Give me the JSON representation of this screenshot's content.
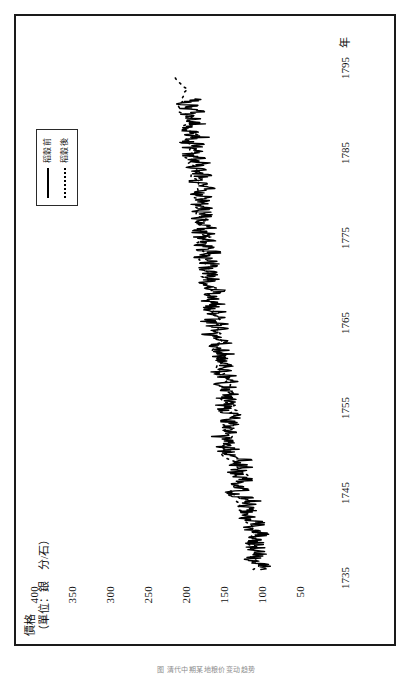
{
  "figure": {
    "caption": "图 清代中期某地粮价变动趋势"
  },
  "legend": {
    "position": "top-left",
    "items": [
      {
        "label": "稻穀前",
        "style": "solid"
      },
      {
        "label": "稻穀後",
        "style": "dashed"
      }
    ]
  },
  "colors": {
    "line": "#000000",
    "frame": "#1a1a1a",
    "background": "#ffffff"
  },
  "chart_data": {
    "type": "line",
    "title": "",
    "subtitle": "",
    "xlabel": "年",
    "ylabel": "價格",
    "ylabel_units": "（單位：銀　分/石）",
    "xlim": [
      1735,
      1796
    ],
    "ylim": [
      25,
      420
    ],
    "xticks": [
      1735,
      1745,
      1755,
      1765,
      1775,
      1785,
      1795
    ],
    "xticklabels": [
      "1735",
      "1745",
      "1755",
      "1765",
      "1775",
      "1785",
      "1795"
    ],
    "yticks": [
      50,
      100,
      150,
      200,
      250,
      300,
      350,
      400
    ],
    "yticklabels": [
      "50",
      "100",
      "150",
      "200",
      "250",
      "300",
      "350",
      "400"
    ],
    "grid": false,
    "rotated_90_ccw": true,
    "series": [
      {
        "name": "稻穀前",
        "style": "solid",
        "x": [
          1736.0,
          1736.3,
          1736.6,
          1736.9,
          1737.2,
          1737.5,
          1737.8,
          1738.1,
          1738.4,
          1738.7,
          1739.0,
          1739.3,
          1739.6,
          1739.9,
          1740.2,
          1740.5,
          1740.8,
          1741.1,
          1741.4,
          1741.7,
          1742.0,
          1742.3,
          1742.6,
          1742.9,
          1743.2,
          1743.5,
          1743.8,
          1744.1,
          1744.4,
          1744.7,
          1745.0,
          1745.3,
          1745.6,
          1745.9,
          1746.2,
          1746.5,
          1746.8,
          1747.1,
          1747.4,
          1747.7,
          1748.0,
          1748.3,
          1748.6,
          1748.9,
          1749.2,
          1749.5,
          1749.8,
          1750.1,
          1750.4,
          1750.7,
          1751.0,
          1751.3,
          1751.6,
          1751.9,
          1752.2,
          1752.5,
          1752.8,
          1753.1,
          1753.4,
          1753.7,
          1754.0,
          1754.3,
          1754.6,
          1754.9,
          1755.2,
          1755.5,
          1755.8,
          1756.1,
          1756.4,
          1756.7,
          1757.0,
          1757.3,
          1757.6,
          1757.9,
          1758.2,
          1758.5,
          1758.8,
          1759.1,
          1759.4,
          1759.7,
          1760.0,
          1760.3,
          1760.6,
          1760.9,
          1761.2,
          1761.5,
          1761.8,
          1762.1,
          1762.4,
          1762.7,
          1763.0,
          1763.3,
          1763.6,
          1763.9,
          1764.2,
          1764.5,
          1764.8,
          1765.1,
          1765.4,
          1765.7,
          1766.0,
          1766.3,
          1766.6,
          1766.9,
          1767.2,
          1767.5,
          1767.8,
          1768.1,
          1768.4,
          1768.7,
          1769.0,
          1769.3,
          1769.6,
          1769.9,
          1770.2,
          1770.5,
          1770.8,
          1771.1,
          1771.4,
          1771.7,
          1772.0,
          1772.3,
          1772.6,
          1772.9,
          1773.2,
          1773.5,
          1773.8,
          1774.1,
          1774.4,
          1774.7,
          1775.0,
          1775.3,
          1775.6,
          1775.9,
          1776.2,
          1776.5,
          1776.8,
          1777.1,
          1777.4,
          1777.7,
          1778.0,
          1778.3,
          1778.6,
          1778.9,
          1779.2,
          1779.5,
          1779.8,
          1780.1,
          1780.4,
          1780.7,
          1781.0,
          1781.3,
          1781.6,
          1781.9,
          1782.2,
          1782.5,
          1782.8,
          1783.1,
          1783.4,
          1783.7,
          1784.0,
          1784.3,
          1784.6,
          1784.9,
          1785.2,
          1785.5,
          1785.8,
          1786.1,
          1786.4,
          1786.7,
          1787.0,
          1787.3,
          1787.6,
          1787.9,
          1788.2,
          1788.5,
          1788.8,
          1789.1,
          1789.4,
          1789.7,
          1790.0,
          1790.3,
          1790.6,
          1790.9,
          1791.2
        ],
        "y": [
          128,
          121,
          118,
          124,
          131,
          126,
          119,
          122,
          130,
          127,
          132,
          126,
          133,
          127,
          120,
          126,
          135,
          129,
          122,
          134,
          141,
          133,
          146,
          138,
          131,
          143,
          137,
          130,
          144,
          152,
          160,
          150,
          143,
          156,
          148,
          139,
          151,
          146,
          158,
          150,
          144,
          152,
          147,
          139,
          150,
          160,
          168,
          159,
          172,
          163,
          155,
          167,
          176,
          168,
          158,
          170,
          163,
          155,
          167,
          159,
          151,
          163,
          172,
          165,
          174,
          168,
          160,
          171,
          164,
          156,
          168,
          162,
          174,
          167,
          159,
          171,
          165,
          178,
          170,
          162,
          173,
          167,
          180,
          174,
          166,
          178,
          172,
          184,
          176,
          168,
          180,
          173,
          186,
          179,
          171,
          183,
          176,
          188,
          181,
          173,
          185,
          178,
          190,
          183,
          176,
          188,
          181,
          193,
          186,
          178,
          190,
          183,
          196,
          188,
          180,
          192,
          185,
          197,
          190,
          182,
          194,
          187,
          199,
          192,
          184,
          196,
          189,
          201,
          194,
          186,
          198,
          191,
          203,
          196,
          188,
          200,
          193,
          205,
          198,
          190,
          202,
          195,
          207,
          200,
          192,
          204,
          197,
          209,
          202,
          194,
          206,
          199,
          211,
          204,
          196,
          208,
          201,
          213,
          206,
          198,
          210,
          203,
          215,
          208,
          200,
          212,
          205,
          217,
          210,
          202,
          214,
          207,
          219,
          212,
          204,
          216,
          209,
          221,
          214,
          206,
          218,
          211,
          223,
          216,
          208
        ]
      },
      {
        "name": "稻穀後",
        "style": "dashed",
        "x": [
          1736.0,
          1737.0,
          1738.0,
          1739.0,
          1740.0,
          1741.0,
          1742.0,
          1743.0,
          1744.0,
          1745.0,
          1746.0,
          1747.0,
          1748.0,
          1749.0,
          1750.0,
          1751.0,
          1752.0,
          1753.0,
          1754.0,
          1755.0,
          1756.0,
          1757.0,
          1758.0,
          1759.0,
          1760.0,
          1761.0,
          1762.0,
          1763.0,
          1764.0,
          1765.0,
          1766.0,
          1767.0,
          1768.0,
          1769.0,
          1770.0,
          1771.0,
          1772.0,
          1773.0,
          1774.0,
          1775.0,
          1776.0,
          1777.0,
          1778.0,
          1779.0,
          1780.0,
          1781.0,
          1782.0,
          1783.0,
          1784.0,
          1785.0,
          1786.0,
          1787.0,
          1788.0,
          1789.0,
          1790.0,
          1791.0,
          1792.0,
          1793.0,
          1794.0
        ],
        "y": [
          124,
          129,
          126,
          131,
          128,
          134,
          140,
          145,
          151,
          158,
          150,
          146,
          154,
          161,
          170,
          166,
          160,
          168,
          162,
          157,
          166,
          171,
          164,
          172,
          178,
          174,
          182,
          177,
          185,
          180,
          188,
          183,
          191,
          186,
          194,
          189,
          197,
          192,
          200,
          195,
          203,
          198,
          206,
          201,
          209,
          204,
          212,
          207,
          215,
          210,
          218,
          213,
          221,
          216,
          224,
          219,
          227,
          222,
          230
        ]
      }
    ],
    "annotations": [
      {
        "text": "主要峰值",
        "x": 1743.0,
        "y": 268
      },
      {
        "text": "主要峰值",
        "x": 1752.5,
        "y": 272
      },
      {
        "text": "主要峰值",
        "x": 1762.0,
        "y": 262
      },
      {
        "text": "主要峰值",
        "x": 1785.5,
        "y": 266
      }
    ]
  }
}
